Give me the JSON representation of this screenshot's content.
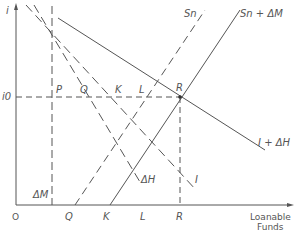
{
  "diagram": {
    "title": "",
    "axes": {
      "y_label": "i",
      "x_label_line1": "Loanable",
      "x_label_line2": "Funds",
      "origin": "O",
      "y_tick": "i0"
    },
    "x_ticks": [
      "Q",
      "K",
      "L",
      "R"
    ],
    "points_on_i0": [
      "P",
      "Q",
      "K",
      "L",
      "R"
    ],
    "curves": {
      "sn": "Sn",
      "sn_dm": "Sn + ΔM",
      "i_dh": "I + ΔH",
      "i": "I",
      "dh": "ΔH",
      "dm": "ΔM"
    },
    "colors": {
      "line": "#555555",
      "background": "#ffffff"
    }
  }
}
